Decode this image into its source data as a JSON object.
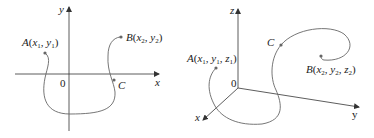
{
  "figures": [
    {
      "id": "2d",
      "axes": {
        "x_label": "x",
        "y_label": "y",
        "origin_label": "0"
      },
      "points": [
        {
          "name": "A",
          "coords": "(x₁, y₁)",
          "var1": "x",
          "sub1": "1",
          "var2": "y",
          "sub2": "1"
        },
        {
          "name": "B",
          "coords": "(x₂, y₂)",
          "var1": "x",
          "sub1": "2",
          "var2": "y",
          "sub2": "2"
        },
        {
          "name": "C"
        }
      ]
    },
    {
      "id": "3d",
      "axes": {
        "x_label": "x",
        "y_label": "y",
        "z_label": "z",
        "origin_label": "0"
      },
      "points": [
        {
          "name": "A",
          "coords": "(x₁, y₁, z₁)",
          "var1": "x",
          "sub1": "1",
          "var2": "y",
          "sub2": "1",
          "var3": "z",
          "sub3": "1"
        },
        {
          "name": "B",
          "coords": "(x₂, y₂, z₂)",
          "var1": "x",
          "sub1": "2",
          "var2": "y",
          "sub2": "2",
          "var3": "z",
          "sub3": "2"
        },
        {
          "name": "C"
        }
      ]
    }
  ],
  "colors": {
    "axis": "#333333",
    "curve": "#666666",
    "point": "#666666",
    "text": "#222222"
  }
}
